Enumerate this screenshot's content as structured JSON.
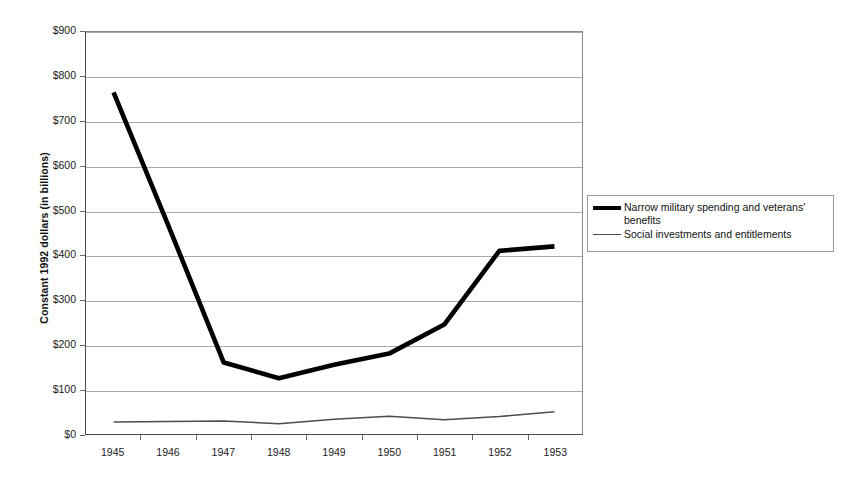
{
  "chart_data": {
    "type": "line",
    "title": "",
    "xlabel": "",
    "ylabel": "Constant 1992 dollars (in billions)",
    "categories": [
      "1945",
      "1946",
      "1947",
      "1948",
      "1949",
      "1950",
      "1951",
      "1952",
      "1953"
    ],
    "x": [
      1945,
      1946,
      1947,
      1948,
      1949,
      1950,
      1951,
      1952,
      1953
    ],
    "ylim": [
      0,
      900
    ],
    "ytick_values": [
      0,
      100,
      200,
      300,
      400,
      500,
      600,
      700,
      800,
      900
    ],
    "ytick_labels": [
      "$0",
      "$100",
      "$200",
      "$300",
      "$400",
      "$500",
      "$600",
      "$700",
      "$800",
      "$900"
    ],
    "grid": "horizontal",
    "legend_position": "right",
    "series": [
      {
        "name": "Narrow military spending and veterans' benefits",
        "values": [
          765,
          465,
          160,
          125,
          155,
          180,
          245,
          410,
          420
        ],
        "color": "#000000",
        "line_width": 4.6
      },
      {
        "name": "Social investments and entitlements",
        "values": [
          27,
          28,
          29,
          23,
          33,
          40,
          32,
          39,
          50
        ],
        "color": "#4d4d4d",
        "line_width": 1.5
      }
    ]
  },
  "axes": {
    "y_title": "Constant 1992 dollars (in billions)",
    "y_ticks": [
      {
        "label": "$900",
        "value": 900
      },
      {
        "label": "$800",
        "value": 800
      },
      {
        "label": "$700",
        "value": 700
      },
      {
        "label": "$600",
        "value": 600
      },
      {
        "label": "$500",
        "value": 500
      },
      {
        "label": "$400",
        "value": 400
      },
      {
        "label": "$300",
        "value": 300
      },
      {
        "label": "$200",
        "value": 200
      },
      {
        "label": "$100",
        "value": 100
      },
      {
        "label": "$0",
        "value": 0
      }
    ],
    "x_ticks": [
      {
        "label": "1945"
      },
      {
        "label": "1946"
      },
      {
        "label": "1947"
      },
      {
        "label": "1948"
      },
      {
        "label": "1949"
      },
      {
        "label": "1950"
      },
      {
        "label": "1951"
      },
      {
        "label": "1952"
      },
      {
        "label": "1953"
      }
    ]
  },
  "legend": {
    "entries": [
      {
        "label": "Narrow military spending and veterans' benefits",
        "style": "thick"
      },
      {
        "label": "Social investments and entitlements",
        "style": "thin"
      }
    ]
  }
}
